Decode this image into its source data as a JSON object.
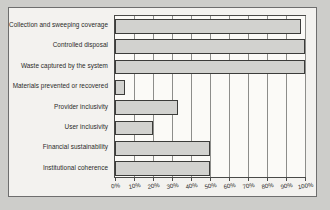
{
  "chart_data": {
    "type": "bar",
    "orientation": "horizontal",
    "title": "",
    "subtitle": "",
    "xlabel": "",
    "ylabel": "",
    "xlim": [
      0,
      100
    ],
    "grid": true,
    "legend": null,
    "legend_position": "none",
    "value_suffix": "%",
    "categories": [
      "Collection and sweeping coverage",
      "Controlled disposal",
      "Waste captured by the system",
      "Materials prevented or recovered",
      "Provider inclusivity",
      "User inclusivity",
      "Financial sustainability",
      "Institutional coherence"
    ],
    "values": [
      98,
      100,
      100,
      5,
      33,
      20,
      50,
      50
    ],
    "xticks": [
      0,
      10,
      20,
      30,
      40,
      50,
      60,
      70,
      80,
      90,
      100
    ],
    "xticklabels": [
      "0%",
      "10%",
      "20%",
      "30%",
      "40%",
      "50%",
      "60%",
      "70%",
      "80%",
      "90%",
      "100%"
    ]
  },
  "style": {
    "bar_fill": "#d2d2cf",
    "bar_border": "#3c3c3a",
    "grid_color": "#8d8d8a",
    "axis_color": "#4a4a48",
    "plot_background": "#fbfaf7",
    "paper_background": "#f3f2ef",
    "page_background": "#cdcdca",
    "text_color": "#2a2a28"
  }
}
